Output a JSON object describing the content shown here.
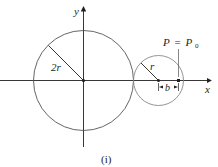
{
  "diagram": {
    "caption": "(i)",
    "axes": {
      "x_label": "x",
      "y_label": "y"
    },
    "large_circle": {
      "radius_label": "2r"
    },
    "small_circle": {
      "radius_label": "r"
    },
    "point_label": {
      "P": "P",
      "eq": "=",
      "P0": "P",
      "sub": "0"
    },
    "offset_label": "b",
    "colors": {
      "line": "#231f20",
      "small_circle": "#777777",
      "big_circle": "#555555"
    }
  }
}
